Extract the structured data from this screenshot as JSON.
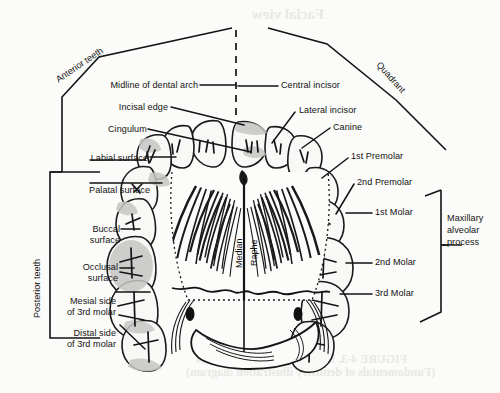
{
  "figure": {
    "view_label": "Facial view",
    "caption_line1": "FIGURE 4-3.   Maxillary occlusal surfaces",
    "caption_line2": "(Fundamentals of dentistry illustration diagram)"
  },
  "brackets": {
    "anterior_teeth": "Anterior teeth",
    "posterior_teeth": "Posterior teeth",
    "quadrant": "Quadrant",
    "maxillary_alveolar_process": "Maxillary\nalveolar\nprocess",
    "maxillary_alveolar_process_lines": [
      "Maxillary",
      "alveolar",
      "process"
    ]
  },
  "midline": {
    "median": "Median",
    "raphe": "Raphe"
  },
  "left_labels": [
    {
      "id": "midline-of-dental-arch",
      "text": "Midline of dental arch"
    },
    {
      "id": "incisal-edge",
      "text": "Incisal edge"
    },
    {
      "id": "cingulum",
      "text": "Cingulum"
    },
    {
      "id": "labial-surface",
      "text": "Labial surface"
    },
    {
      "id": "palatal-surface",
      "text": "Palatal surface"
    },
    {
      "id": "buccal-surface",
      "text": "Buccal surface",
      "lines": [
        "Buccal",
        "surface"
      ]
    },
    {
      "id": "occlusal-surface",
      "text": "Occlusal surface",
      "lines": [
        "Occlusal",
        "surface"
      ]
    },
    {
      "id": "mesial-side-of-3rd-molar",
      "text": "Mesial side of 3rd molar",
      "lines": [
        "Mesial side",
        "of 3rd molar"
      ]
    },
    {
      "id": "distal-side-of-3rd-molar",
      "text": "Distal side of 3rd molar",
      "lines": [
        "Distal side",
        "of 3rd molar"
      ]
    }
  ],
  "right_labels": [
    {
      "id": "central-incisor",
      "text": "Central incisor"
    },
    {
      "id": "lateral-incisor",
      "text": "Lateral incisor"
    },
    {
      "id": "canine",
      "text": "Canine"
    },
    {
      "id": "first-premolar",
      "text": "1st Premolar"
    },
    {
      "id": "second-premolar",
      "text": "2nd Premolar"
    },
    {
      "id": "first-molar",
      "text": "1st Molar"
    },
    {
      "id": "second-molar",
      "text": "2nd Molar"
    },
    {
      "id": "third-molar",
      "text": "3rd Molar"
    }
  ],
  "colors": {
    "ink": "#131313",
    "page": "#fbfbf9",
    "tooth_fill": "#f7f7f5",
    "highlight_fill": "#c9c9c7",
    "bleed": "#e8e8e4"
  }
}
